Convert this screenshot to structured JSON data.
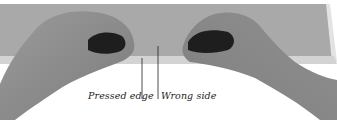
{
  "image": {
    "description": "Two hands folding a strip of fabric along a pressed edge",
    "colors": {
      "fabric": "#a9a9a9",
      "pressed_edge": "#d2d2d2",
      "skin": "#8e8e8e",
      "shadow": "#1e1e1e",
      "background": "#ffffff"
    }
  },
  "labels": {
    "pressed_edge": "Pressed edge",
    "wrong_side": "Wrong side"
  }
}
